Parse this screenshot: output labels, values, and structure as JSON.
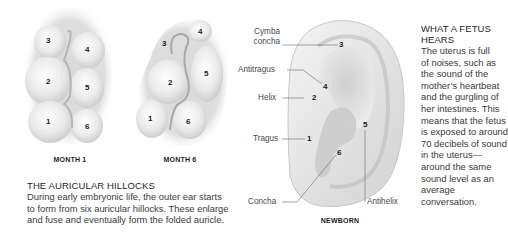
{
  "hillocks": {
    "month1": {
      "caption": "MONTH 1",
      "numbers": [
        "1",
        "2",
        "3",
        "4",
        "5",
        "6"
      ]
    },
    "month6": {
      "caption": "MONTH 6",
      "numbers": [
        "1",
        "2",
        "3",
        "4",
        "5",
        "6"
      ]
    },
    "section": {
      "heading": "THE AURICULAR HILLOCKS",
      "lines": [
        "During early embryonic life, the outer ear starts",
        "to form from six auricular hillocks. These enlarge",
        "and fuse and eventually form the folded auricle."
      ]
    }
  },
  "newborn": {
    "caption": "NEWBORN",
    "labels": {
      "cymba_concha_1": "Cymba",
      "cymba_concha_2": "concha",
      "antitragus": "Antitragus",
      "helix": "Helix",
      "tragus": "Tragus",
      "concha": "Concha",
      "antihelix": "Antihelix"
    },
    "numbers": {
      "cymba_concha": "3",
      "antitragus": "4",
      "helix": "2",
      "tragus": "1",
      "antihelix": "5",
      "concha": "6"
    }
  },
  "sidebar": {
    "heading_lines": [
      "WHAT A FETUS",
      "HEARS"
    ],
    "lines": [
      "The uterus is full",
      "of noises, such as",
      "the sound of the",
      "mother’s heartbeat",
      "and the gurgling of",
      "her intestines. This",
      "means that the fetus",
      "is exposed to around",
      "70 decibels of sound",
      "in the uterus—",
      "around the same",
      "sound level as an",
      "average conversation."
    ]
  }
}
